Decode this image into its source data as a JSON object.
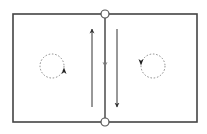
{
  "diagram": {
    "type": "flow-cell-diagram",
    "colors": {
      "frame": "#444444",
      "arrow": "#333333",
      "dashed": "#888888",
      "node_fill": "#ffffff",
      "background": "#ffffff"
    },
    "frame": {
      "x": 13,
      "y": 14,
      "width": 184,
      "height": 108
    },
    "divider": {
      "x": 105,
      "y1": 14,
      "y2": 122,
      "marker": "down-arrowhead",
      "marker_y": 65
    },
    "nodes": [
      {
        "name": "top-node",
        "cx": 105,
        "cy": 14,
        "r": 4
      },
      {
        "name": "bottom-node",
        "cx": 105,
        "cy": 122,
        "r": 4
      }
    ],
    "arrows": [
      {
        "name": "upward-flow-arrow",
        "x": 92,
        "y_start": 107,
        "y_end": 29,
        "direction": "up"
      },
      {
        "name": "downward-flow-arrow",
        "x": 117,
        "y_start": 29,
        "y_end": 107,
        "direction": "down"
      }
    ],
    "vortices": [
      {
        "name": "left-vortex",
        "cx": 52,
        "cy": 66,
        "r": 12,
        "rotation": "counter-clockwise"
      },
      {
        "name": "right-vortex",
        "cx": 153,
        "cy": 66,
        "r": 12,
        "rotation": "clockwise"
      }
    ]
  }
}
